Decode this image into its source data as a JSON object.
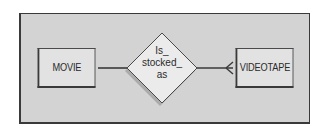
{
  "diagram": {
    "type": "entity-relationship",
    "entities": [
      {
        "id": "movie",
        "label": "MOVIE"
      },
      {
        "id": "videotape",
        "label": "VIDEOTAPE"
      }
    ],
    "relationship": {
      "label_lines": [
        "Is_",
        "stocked_",
        "as"
      ],
      "from": "movie",
      "to": "videotape",
      "from_cardinality": "one",
      "to_cardinality": "many"
    },
    "colors": {
      "background": "#d3d3d3",
      "entity_fill": "#e2e2e2",
      "diamond_fill": "#ebebeb",
      "stroke": "#3a3a3a",
      "shadow": "#9a9a9a"
    }
  }
}
